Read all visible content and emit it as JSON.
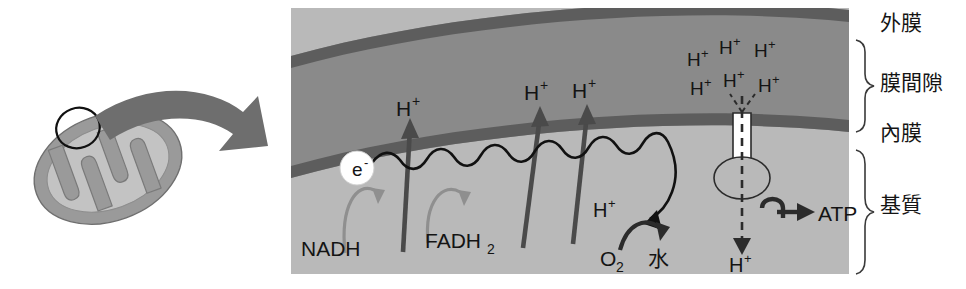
{
  "figure": {
    "language": "ja",
    "palette": {
      "background": "#ffffff",
      "membrane_dark": "#5d5d5d",
      "intermembrane_space": "#8a8a8a",
      "matrix": "#b9b9b9",
      "organelle_outer": "#9a9a9a",
      "organelle_inner": "#c3c3c3",
      "callout_arrow": "#6e6e6e",
      "pump_arrow": "#4a4a4a",
      "donor_arrow": "#8f8f8f",
      "ink": "#141414",
      "electron_badge": "#ffffff"
    }
  },
  "organelle": {
    "name": "mitochondrion-overview",
    "callout_circle": "magnified-region",
    "zoom_arrow": "zoom-arrow"
  },
  "compartments": {
    "outer_membrane": "外膜",
    "intermembrane_space": "膜間隙",
    "inner_membrane": "內膜",
    "matrix": "基質"
  },
  "electron": {
    "badge": "e",
    "charge": "-"
  },
  "donors": [
    {
      "id": "nadh",
      "label": "NADH"
    },
    {
      "id": "fadh2",
      "label": "FADH",
      "sub": "2"
    }
  ],
  "pumped_protons": [
    {
      "id": "pump-1",
      "label": "H",
      "charge": "+"
    },
    {
      "id": "pump-2",
      "label": "H",
      "charge": "+"
    },
    {
      "id": "pump-3",
      "label": "H",
      "charge": "+"
    }
  ],
  "proton_gradient": {
    "count": 6,
    "label": "H",
    "charge": "+",
    "items": [
      {
        "id": "ims-h-1",
        "label": "H",
        "charge": "+"
      },
      {
        "id": "ims-h-2",
        "label": "H",
        "charge": "+"
      },
      {
        "id": "ims-h-3",
        "label": "H",
        "charge": "+"
      },
      {
        "id": "ims-h-4",
        "label": "H",
        "charge": "+"
      },
      {
        "id": "ims-h-5",
        "label": "H",
        "charge": "+"
      },
      {
        "id": "ims-h-6",
        "label": "H",
        "charge": "+"
      }
    ]
  },
  "terminal_reaction": {
    "proton": {
      "label": "H",
      "charge": "+"
    },
    "oxygen": {
      "label": "O",
      "sub": "2"
    },
    "product": "水"
  },
  "atp_synthase": {
    "name": "atp-synthase",
    "flow_proton": {
      "label": "H",
      "charge": "+"
    },
    "product": "ATP"
  }
}
